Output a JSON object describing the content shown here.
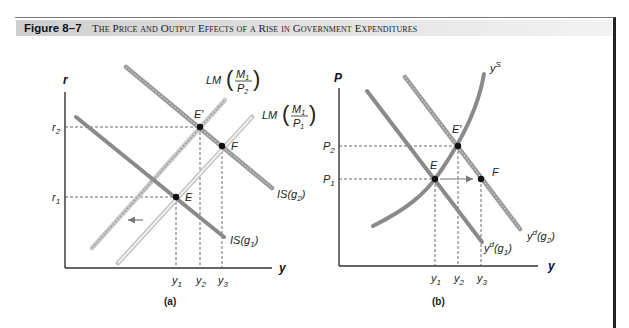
{
  "figure": {
    "label": "Figure 8–7",
    "title": "The Price and Output Effects of a Rise in Government Expenditures"
  },
  "panel_a": {
    "caption": "(a)",
    "x_axis": "y",
    "y_axis": "r",
    "y_ticks": [
      "r2",
      "r1"
    ],
    "x_ticks": [
      "y1",
      "y2",
      "y3"
    ],
    "curves": {
      "lm_p2": "LM(M1/P2)",
      "lm_p1": "LM(M1/P1)",
      "is_g2": "IS(g2)",
      "is_g1": "IS(g1)"
    },
    "points": [
      "E",
      "E'",
      "F"
    ]
  },
  "panel_b": {
    "caption": "(b)",
    "x_axis": "y",
    "y_axis": "P",
    "y_ticks": [
      "P2",
      "P1"
    ],
    "x_ticks": [
      "y1",
      "y2",
      "y3"
    ],
    "curves": {
      "ys": "y^S",
      "yd_g1": "y^d(g1)",
      "yd_g2": "y^d(g2)"
    },
    "points": [
      "E",
      "E'",
      "F"
    ]
  },
  "colors": {
    "curve_dark": "#8a8a8a",
    "curve_light": "#cfcfcf",
    "axis": "#333333",
    "title_bar": "#d9d9d9"
  }
}
